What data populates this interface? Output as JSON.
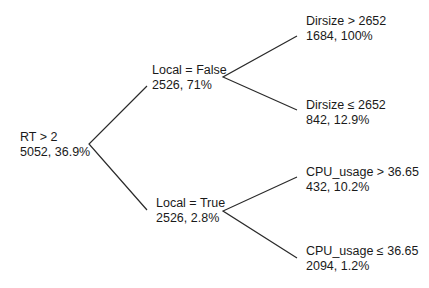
{
  "diagram": {
    "type": "decision-tree",
    "root": {
      "condition": "RT > 2",
      "stats": "5052, 36.9%"
    },
    "level1": [
      {
        "condition": "Local = False",
        "stats": "2526, 71%"
      },
      {
        "condition": "Local = True",
        "stats": "2526, 2.8%"
      }
    ],
    "leaves": [
      {
        "condition": "Dirsize > 2652",
        "stats": "1684, 100%"
      },
      {
        "condition": "Dirsize ≤ 2652",
        "stats": "842, 12.9%"
      },
      {
        "condition": "CPU_usage > 36.65",
        "stats": "432, 10.2%"
      },
      {
        "condition": "CPU_usage ≤ 36.65",
        "stats": "2094, 1.2%"
      }
    ],
    "colors": {
      "line": "#2a2a2a",
      "text": "#1a1a1a",
      "background": "#ffffff"
    }
  }
}
